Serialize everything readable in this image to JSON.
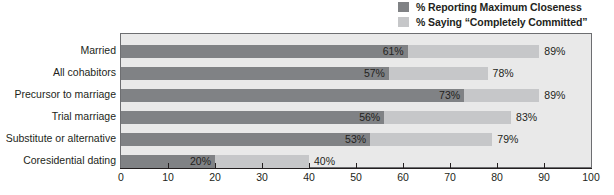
{
  "chart_data": {
    "type": "bar",
    "orientation": "horizontal",
    "overlay": true,
    "title": "",
    "subtitle": "",
    "xlabel": "",
    "ylabel": "",
    "xlim": [
      0,
      100
    ],
    "xticks": [
      0,
      10,
      20,
      30,
      40,
      50,
      60,
      70,
      80,
      90,
      100
    ],
    "grid": false,
    "legend_position": "top-right",
    "categories": [
      "Married",
      "All cohabitors",
      "Precursor to marriage",
      "Trial marriage",
      "Substitute or alternative",
      "Coresidential dating"
    ],
    "series": [
      {
        "name": "% Reporting Maximum Closeness",
        "color": "#808285",
        "values": [
          61,
          57,
          73,
          56,
          53,
          20
        ],
        "labels": [
          "61%",
          "57%",
          "73%",
          "56%",
          "53%",
          "20%"
        ]
      },
      {
        "name": "% Saying “Completely Committed”",
        "color": "#c6c7c9",
        "values": [
          89,
          78,
          89,
          83,
          79,
          40
        ],
        "labels": [
          "89%",
          "78%",
          "89%",
          "83%",
          "79%",
          "40%"
        ]
      }
    ]
  },
  "legend": {
    "items": [
      {
        "label": "% Reporting Maximum Closeness",
        "color": "#808285"
      },
      {
        "label": "% Saying “Completely Committed”",
        "color": "#c6c7c9"
      }
    ]
  },
  "axis": {
    "tick_labels": [
      "0",
      "10",
      "20",
      "30",
      "40",
      "50",
      "60",
      "70",
      "80",
      "90",
      "100"
    ]
  },
  "colors": {
    "dark_series": "#808285",
    "light_series": "#c6c7c9",
    "plot_background": "#e9e9e9",
    "plot_border": "#6d6e71",
    "text": "#231f20"
  }
}
